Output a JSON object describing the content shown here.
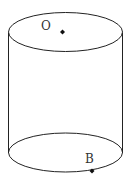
{
  "figure": {
    "type": "cylinder",
    "labels": {
      "top_center": "O",
      "bottom_point": "B"
    },
    "colors": {
      "stroke": "#222222",
      "point": "#111111",
      "background": "#ffffff"
    }
  }
}
